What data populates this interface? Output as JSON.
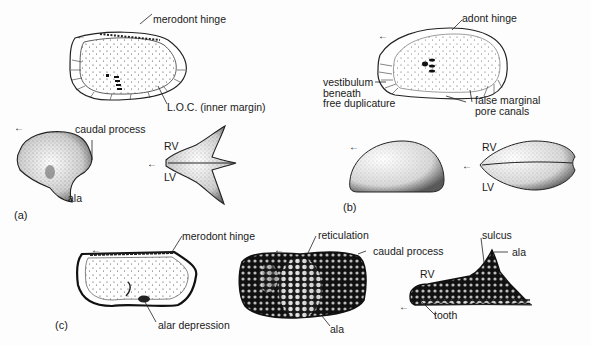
{
  "figure": {
    "panels": [
      {
        "id": "a",
        "label": "(a)",
        "annotations": {
          "hinge": "merodont hinge",
          "loc": "L.O.C. (inner margin)",
          "caudal_process": "caudal process",
          "ala": "ala",
          "rv": "RV",
          "lv": "LV"
        }
      },
      {
        "id": "b",
        "label": "(b)",
        "annotations": {
          "hinge": "adont hinge",
          "vestibulum_1": "vestibulum",
          "vestibulum_2": "beneath",
          "vestibulum_3": "free duplicature",
          "false_canals_1": "false marginal",
          "false_canals_2": "pore canals",
          "rv": "RV",
          "lv": "LV"
        }
      },
      {
        "id": "c",
        "label": "(c)",
        "annotations": {
          "hinge": "merodont hinge",
          "alar_depression": "alar depression",
          "reticulation": "reticulation",
          "caudal_process": "caudal process",
          "ala_mid": "ala",
          "sulcus": "sulcus",
          "ala_right": "ala",
          "rv": "RV",
          "tooth": "tooth"
        }
      }
    ],
    "arrow_glyph": "←"
  }
}
